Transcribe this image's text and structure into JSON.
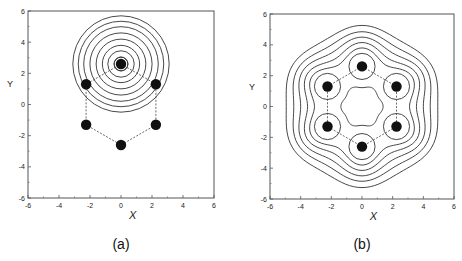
{
  "chart_data": [
    {
      "type": "contour",
      "panel_label": "(a)",
      "xlabel": "X",
      "ylabel": "Y",
      "xlim": [
        -6,
        6
      ],
      "ylim": [
        -6,
        6
      ],
      "xticks": [
        -6,
        -4,
        -2,
        0,
        2,
        4,
        6
      ],
      "yticks": [
        -6,
        -4,
        -2,
        0,
        2,
        4,
        6
      ],
      "grid": false,
      "atoms": [
        {
          "x": 0,
          "y": 2.6
        },
        {
          "x": 2.25,
          "y": 1.3
        },
        {
          "x": 2.25,
          "y": -1.3
        },
        {
          "x": 0,
          "y": -2.6
        },
        {
          "x": -2.25,
          "y": -1.3
        },
        {
          "x": -2.25,
          "y": 1.3
        }
      ],
      "contour_center": {
        "x": 0,
        "y": 2.6
      },
      "contour_radii": [
        0.45,
        0.85,
        1.2,
        1.6,
        2.0,
        2.4,
        2.75,
        3.1
      ]
    },
    {
      "type": "contour",
      "panel_label": "(b)",
      "xlabel": "X",
      "ylabel": "Y",
      "xlim": [
        -6,
        6
      ],
      "ylim": [
        -6,
        6
      ],
      "xticks": [
        -6,
        -4,
        -2,
        0,
        2,
        4,
        6
      ],
      "yticks": [
        -6,
        -4,
        -2,
        0,
        2,
        4,
        6
      ],
      "grid": false,
      "atoms": [
        {
          "x": 0,
          "y": 2.6
        },
        {
          "x": 2.25,
          "y": 1.3
        },
        {
          "x": 2.25,
          "y": -1.3
        },
        {
          "x": 0,
          "y": -2.6
        },
        {
          "x": -2.25,
          "y": -1.3
        },
        {
          "x": -2.25,
          "y": 1.3
        }
      ],
      "atom_contour_radius": 0.85,
      "central_hexagon_radius": 1.3,
      "outer_contours": [
        {
          "r": 3.45,
          "wave": 0.35
        },
        {
          "r": 3.85,
          "wave": 0.3
        },
        {
          "r": 4.25,
          "wave": 0.25
        },
        {
          "r": 4.65,
          "wave": 0.2
        },
        {
          "r": 5.1,
          "wave": 0.16
        }
      ]
    }
  ]
}
